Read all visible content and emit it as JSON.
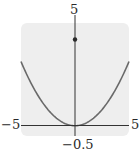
{
  "chart_data": {
    "type": "line",
    "title": "",
    "xlabel": "",
    "ylabel": "",
    "xlim": [
      -5,
      5
    ],
    "ylim": [
      -0.5,
      5
    ],
    "grid": false,
    "legend": null,
    "tick_labels": {
      "x_min": "−5",
      "x_max": "5",
      "y_min": "−0.5",
      "y_max": "5"
    },
    "series": [
      {
        "name": "parabola",
        "equation": "y ≈ x²/8",
        "x": [
          -5,
          -4,
          -3,
          -2,
          -1,
          0,
          1,
          2,
          3,
          4,
          5
        ],
        "y": [
          3.1,
          2.0,
          1.1,
          0.5,
          0.1,
          0,
          0.1,
          0.5,
          1.1,
          2.0,
          3.1
        ],
        "color": "#6a6a6a"
      }
    ],
    "points": [
      {
        "name": "marked-point",
        "x": 0,
        "y": 4.2,
        "color": "#2a2a2a"
      }
    ],
    "colors": {
      "frame_background": "#eeeeee",
      "axes": "#333333",
      "curve": "#6a6a6a"
    }
  },
  "labels": {
    "top": "5",
    "left": "−5",
    "right": "5",
    "bottom": "−0.5"
  }
}
